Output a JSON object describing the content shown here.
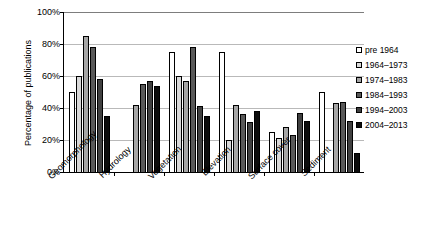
{
  "chart_data": {
    "type": "bar",
    "title": "",
    "xlabel": "",
    "ylabel": "Percentage of publications",
    "ylim": [
      0,
      100
    ],
    "ytick_labels": [
      "0%",
      "20%",
      "40%",
      "60%",
      "80%",
      "100%"
    ],
    "ytick_values": [
      0,
      20,
      40,
      60,
      80,
      100
    ],
    "grid": true,
    "legend_position": "right",
    "categories": [
      "Geomorphology",
      "Hydrology",
      "Vegetation",
      "Elevation",
      "Surface cover",
      "Sediment"
    ],
    "series": [
      {
        "name": "pre 1964",
        "color": "#ffffff",
        "values": [
          50,
          0,
          75,
          75,
          25,
          50
        ]
      },
      {
        "name": "1964–1973",
        "color": "#d9d9d9",
        "values": [
          60,
          0,
          60,
          20,
          21,
          0
        ]
      },
      {
        "name": "1974–1983",
        "color": "#a6a6a6",
        "values": [
          85,
          42,
          57,
          42,
          28,
          43
        ]
      },
      {
        "name": "1984–1993",
        "color": "#595959",
        "values": [
          78,
          55,
          78,
          36,
          23,
          44
        ]
      },
      {
        "name": "1994–2003",
        "color": "#404040",
        "values": [
          58,
          57,
          41,
          31,
          37,
          32
        ]
      },
      {
        "name": "2004–2013",
        "color": "#0d0d0d",
        "values": [
          35,
          54,
          35,
          38,
          32,
          12
        ]
      }
    ]
  }
}
